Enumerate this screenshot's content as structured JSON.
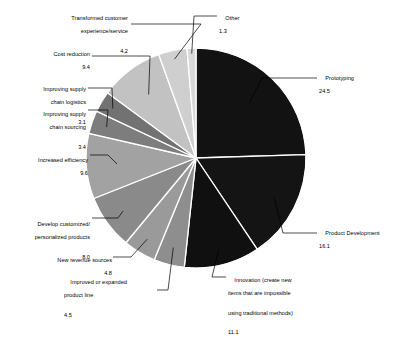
{
  "chart_data": {
    "type": "pie",
    "title": "",
    "subtitle": "",
    "xlabel": "",
    "ylabel": "",
    "legend_position": "none",
    "grid": false,
    "start_angle_deg": 0,
    "direction": "clockwise",
    "units": "percent",
    "categories": [
      "Prototyping",
      "Product Development",
      "Innovation (create new items that are impossible using traditional methods)",
      "Improved or expanded product line",
      "New revenue sources",
      "Develop customized/personalized products",
      "Increased efficiency",
      "Improving supply chain sourcing",
      "Improving supply chain logistics",
      "Cost reduction",
      "Transformed customer experience/service",
      "Other"
    ],
    "values": [
      24.5,
      16.1,
      11.1,
      4.5,
      4.8,
      8.0,
      9.6,
      3.4,
      3.1,
      9.4,
      4.2,
      1.3
    ],
    "colors": [
      "#121212",
      "#141414",
      "#101010",
      "#8e8e8e",
      "#9a9a9a",
      "#8a8a8a",
      "#a2a2a2",
      "#7d7d7d",
      "#727272",
      "#c2c2c2",
      "#cfcfcf",
      "#d8d8d8"
    ],
    "slice_separator_color": "#ffffff"
  },
  "labels": [
    {
      "name": "transformed-customer",
      "lines": [
        "Transformed customer",
        "experience/service"
      ],
      "value": "4.2"
    },
    {
      "name": "other",
      "lines": [
        "Other"
      ],
      "value": "1.3"
    },
    {
      "name": "prototyping",
      "lines": [
        "Prototyping"
      ],
      "value": "24.5"
    },
    {
      "name": "cost-reduction",
      "lines": [
        "Cost reduction"
      ],
      "value": "9.4"
    },
    {
      "name": "improving-supply-chain-logistics",
      "lines": [
        "Improving supply",
        "chain logistics"
      ],
      "value": "3.1"
    },
    {
      "name": "improving-supply-chain-sourcing",
      "lines": [
        "Improving supply",
        "chain sourcing"
      ],
      "value": "3.4"
    },
    {
      "name": "increased-efficiency",
      "lines": [
        "Increased efficiency"
      ],
      "value": "9.6"
    },
    {
      "name": "develop-customized-products",
      "lines": [
        "Develop customized/",
        "personalized products"
      ],
      "value": "8.0"
    },
    {
      "name": "new-revenue-sources",
      "lines": [
        "New revenue sources"
      ],
      "value": "4.8"
    },
    {
      "name": "improved-or-expanded-product-line",
      "lines": [
        "Improved or expanded",
        "product line"
      ],
      "value": "4.5"
    },
    {
      "name": "innovation",
      "lines": [
        "Innovation (create new",
        "items that are impossible",
        "using traditional methods)"
      ],
      "value": "11.1"
    },
    {
      "name": "product-development",
      "lines": [
        "Product Development"
      ],
      "value": "16.1"
    }
  ]
}
